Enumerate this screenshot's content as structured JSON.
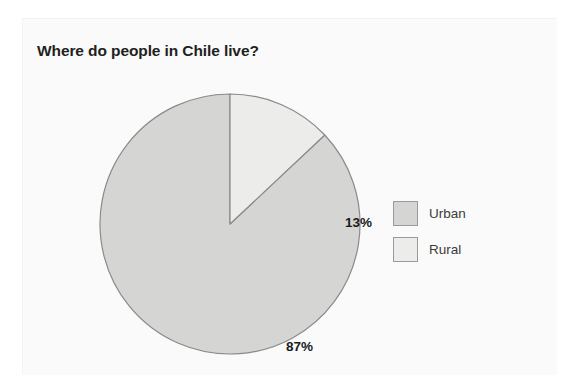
{
  "chart_data": {
    "type": "pie",
    "title": "Where do people in Chile live?",
    "categories": [
      "Urban",
      "Rural"
    ],
    "values": [
      87,
      13
    ],
    "value_labels": [
      "87%",
      "13%"
    ],
    "units": "percent",
    "total": 100,
    "start_angle_deg": 0,
    "direction": "clockwise",
    "legend_position": "right",
    "grid": false,
    "xlabel": "",
    "ylabel": "",
    "slices": [
      {
        "name": "Urban",
        "value": 87,
        "label": "87%",
        "color": "#d5d5d3",
        "stroke": "#8a8a8a",
        "start_deg": 46.8,
        "end_deg": 360
      },
      {
        "name": "Rural",
        "value": 13,
        "label": "13%",
        "color": "#ececea",
        "stroke": "#8a8a8a",
        "start_deg": 0,
        "end_deg": 46.8
      }
    ]
  },
  "legend": {
    "items": [
      {
        "label": "Urban",
        "color": "#d5d5d3"
      },
      {
        "label": "Rural",
        "color": "#ececea"
      }
    ]
  },
  "colors": {
    "background": "#ffffff",
    "panel": "#fafafa",
    "title_text": "#231f20",
    "label_text": "#1a1a1a",
    "legend_text": "#3a3a3a",
    "urban_fill": "#d5d5d3",
    "rural_fill": "#ececea",
    "slice_stroke": "#8a8a8a"
  }
}
